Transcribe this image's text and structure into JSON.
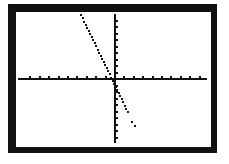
{
  "chart_data": {
    "type": "line",
    "title": "",
    "xlabel": "",
    "ylabel": "",
    "window": {
      "xmin": -10,
      "xmax": 10,
      "xscl": 1,
      "ymin": -10,
      "ymax": 10,
      "yscl": 1
    },
    "grid": false,
    "legend": null,
    "series": [
      {
        "name": "Y1",
        "equation": "y = -3x - 1",
        "slope": -3,
        "intercept": -1,
        "x": [
          -3.5,
          -3,
          -2,
          -1,
          0,
          1,
          1.5,
          1.8,
          2
        ],
        "y": [
          9.5,
          8,
          5,
          2,
          -1,
          -4,
          -5.5,
          -6.4,
          -7
        ]
      }
    ]
  },
  "colors": {
    "frame": "#111111",
    "screen": "#ffffff",
    "ink": "#111111"
  }
}
